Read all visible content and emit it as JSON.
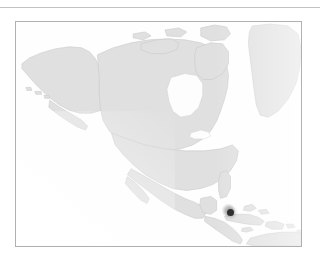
{
  "figure": {
    "type": "locator-map",
    "region": "North America",
    "frame": {
      "x": 15,
      "y": 21,
      "width": 287,
      "height": 226
    },
    "top_rule": {
      "y": 7,
      "width": 320
    }
  },
  "colors": {
    "page_background": "#ffffff",
    "map_background": "#fefefe",
    "frame_border": "#b0b0b0",
    "rule": "#b9b9b9",
    "land_fill": "#dedede",
    "land_stroke": "#c4c4c4",
    "marker_fill": "#2f2f2f",
    "marker_halo": "#787878"
  },
  "map": {
    "title": "",
    "projection": "plate-carree",
    "lon_range": [
      -172,
      -52
    ],
    "lat_range": [
      2,
      76
    ],
    "ocean_label": "",
    "landmasses": [
      {
        "name": "alaska"
      },
      {
        "name": "canada-mainland"
      },
      {
        "name": "canadian-arctic-archipelago"
      },
      {
        "name": "greenland"
      },
      {
        "name": "hudson-bay"
      },
      {
        "name": "united-states"
      },
      {
        "name": "mexico"
      },
      {
        "name": "central-america"
      },
      {
        "name": "caribbean-islands"
      },
      {
        "name": "northern-south-america"
      }
    ]
  },
  "markers": [
    {
      "name": "occurrence-point",
      "label": "",
      "x_px": 229,
      "y_px": 211,
      "radius_px": 3.5,
      "color": "#2f2f2f"
    }
  ],
  "legend": {
    "visible": false,
    "entries": []
  },
  "axes": {
    "visible": false,
    "ticks": [],
    "gridlines": false
  },
  "scalebar": {
    "visible": false
  },
  "north_arrow": {
    "visible": false
  },
  "accessibility": {
    "figure_description": "Faint grayscale outline map of North America, the Caribbean and northern South America, with a single dark point marker located in the Caribbean."
  }
}
